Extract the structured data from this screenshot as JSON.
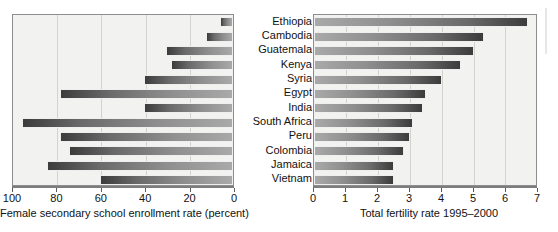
{
  "figure": {
    "title": "",
    "categories": [
      "Ethiopia",
      "Cambodia",
      "Guatemala",
      "Kenya",
      "Syria",
      "Egypt",
      "India",
      "South Africa",
      "Peru",
      "Colombia",
      "Jamaica",
      "Vietnam"
    ]
  },
  "left_panel": {
    "axis_title": "Female secondary school enrollment rate (percent)",
    "tick_labels": [
      "100",
      "80",
      "60",
      "40",
      "20",
      "0"
    ]
  },
  "right_panel": {
    "axis_title": "Total fertility rate 1995–2000",
    "tick_labels": [
      "0",
      "1",
      "2",
      "3",
      "4",
      "5",
      "6",
      "7"
    ]
  },
  "colors": {
    "plot_background": "#f2f2f0",
    "frame": "#8d8d8d",
    "gridline": "#d2d2cf",
    "bar_dark": "#3c3c3c",
    "bar_light": "#a9a9a9",
    "text": "#111111"
  },
  "chart_data": [
    {
      "type": "bar",
      "orientation": "horizontal",
      "title": "",
      "xlabel": "Female secondary school enrollment rate (percent)",
      "ylabel": "",
      "xlim": [
        100,
        0
      ],
      "x_axis_reversed": true,
      "xticks": [
        100,
        80,
        60,
        40,
        20,
        0
      ],
      "grid": true,
      "legend": "none",
      "categories": [
        "Ethiopia",
        "Cambodia",
        "Guatemala",
        "Kenya",
        "Syria",
        "Egypt",
        "India",
        "South Africa",
        "Peru",
        "Colombia",
        "Jamaica",
        "Vietnam"
      ],
      "values": [
        6,
        12,
        30,
        28,
        40,
        78,
        40,
        95,
        78,
        74,
        84,
        60
      ]
    },
    {
      "type": "bar",
      "orientation": "horizontal",
      "title": "",
      "xlabel": "Total fertility rate 1995–2000",
      "ylabel": "",
      "xlim": [
        0,
        7
      ],
      "x_axis_reversed": false,
      "xticks": [
        0,
        1,
        2,
        3,
        4,
        5,
        6,
        7
      ],
      "grid": true,
      "legend": "none",
      "categories": [
        "Ethiopia",
        "Cambodia",
        "Guatemala",
        "Kenya",
        "Syria",
        "Egypt",
        "India",
        "South Africa",
        "Peru",
        "Colombia",
        "Jamaica",
        "Vietnam"
      ],
      "values": [
        6.7,
        5.3,
        5.0,
        4.6,
        4.0,
        3.5,
        3.4,
        3.1,
        3.0,
        2.8,
        2.5,
        2.5
      ]
    }
  ]
}
